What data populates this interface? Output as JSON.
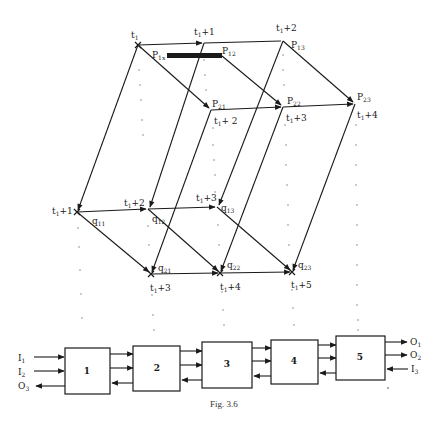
{
  "figure": {
    "caption": "Fig. 3.6",
    "type": "timed-petri-net-unfolding-with-pipeline"
  },
  "nodes": {
    "top": [
      {
        "id": "t1",
        "time": "t",
        "time_sub": "1",
        "time_suffix": "",
        "label": "",
        "label_sub": "",
        "x": 138,
        "y": 45
      },
      {
        "id": "t1p1",
        "time": "t",
        "time_sub": "1",
        "time_suffix": "+1",
        "label": "",
        "label_sub": "",
        "x": 204,
        "y": 43
      },
      {
        "id": "p13",
        "time": "t",
        "time_sub": "1",
        "time_suffix": "+2",
        "label": "P",
        "label_sub": "13",
        "x": 283,
        "y": 41
      }
    ],
    "middle": [
      {
        "id": "p21",
        "time": "t",
        "time_sub": "1",
        "time_suffix": "+ 2",
        "label": "P",
        "label_sub": "21",
        "x": 211,
        "y": 110
      },
      {
        "id": "p22",
        "time": "t",
        "time_sub": "1",
        "time_suffix": "+3",
        "label": "P",
        "label_sub": "22",
        "x": 283,
        "y": 107
      },
      {
        "id": "p23",
        "time": "t",
        "time_sub": "1",
        "time_suffix": "+4",
        "label": "P",
        "label_sub": "23",
        "x": 355,
        "y": 104
      }
    ],
    "lower": [
      {
        "id": "q11",
        "time": "t",
        "time_sub": "1",
        "time_suffix": "+1",
        "label": "q",
        "label_sub": "11",
        "x": 77,
        "y": 212
      },
      {
        "id": "q12",
        "time": "t",
        "time_sub": "1",
        "time_suffix": "+2",
        "label": "q",
        "label_sub": "12",
        "x": 148,
        "y": 209
      },
      {
        "id": "q13",
        "time": "t",
        "time_sub": "1",
        "time_suffix": "+3",
        "label": "q",
        "label_sub": "13",
        "x": 217,
        "y": 207
      }
    ],
    "bottom": [
      {
        "id": "q21",
        "time": "t",
        "time_sub": "1",
        "time_suffix": "+3",
        "label": "q",
        "label_sub": "21",
        "x": 151,
        "y": 274
      },
      {
        "id": "q22",
        "time": "t",
        "time_sub": "1",
        "time_suffix": "+4",
        "label": "q",
        "label_sub": "22",
        "x": 220,
        "y": 273
      },
      {
        "id": "q23",
        "time": "t",
        "time_sub": "1",
        "time_suffix": "+5",
        "label": "q",
        "label_sub": "23",
        "x": 292,
        "y": 272
      }
    ]
  },
  "extra_labels": {
    "p1x": {
      "text": "P",
      "sub": "1x"
    },
    "p12": {
      "text": "P",
      "sub": "12"
    }
  },
  "pipeline": {
    "boxes": [
      {
        "label": "1"
      },
      {
        "label": "2"
      },
      {
        "label": "3"
      },
      {
        "label": "4"
      },
      {
        "label": "5"
      }
    ],
    "inputs_left": [
      {
        "text": "I",
        "sub": "1",
        "direction": "in"
      },
      {
        "text": "I",
        "sub": "2",
        "direction": "in"
      },
      {
        "text": "O",
        "sub": "3",
        "direction": "out"
      }
    ],
    "outputs_right": [
      {
        "text": "O",
        "sub": "1",
        "direction": "out"
      },
      {
        "text": "O",
        "sub": "2",
        "direction": "out"
      },
      {
        "text": "I",
        "sub": "3",
        "direction": "in"
      }
    ]
  },
  "colors": {
    "ink": "#1a1a1a",
    "dots": "#888888",
    "background": "#ffffff"
  }
}
